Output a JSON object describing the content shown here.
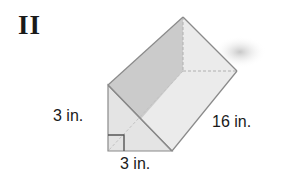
{
  "figure": {
    "label": "II",
    "shape": "triangular-prism"
  },
  "dimensions": {
    "height": "3 in.",
    "base": "3 in.",
    "length": "16 in."
  },
  "colors": {
    "edge": "#8a8a8a",
    "top_face": "#c9c9c9",
    "front_face": "#e6e6e6",
    "slant_face": "#ececec",
    "hidden_edge": "#b0b0b0",
    "right_angle_marker": "#555555",
    "text": "#1a1a1a"
  }
}
